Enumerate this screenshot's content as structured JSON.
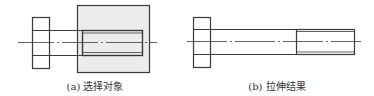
{
  "figure_a": {
    "caption": "(a) 选择对象",
    "selection_fill": "#ececec",
    "line_color": "#3a3a3a"
  },
  "figure_b": {
    "caption": "(b) 拉伸结果",
    "line_color": "#3a3a3a"
  }
}
